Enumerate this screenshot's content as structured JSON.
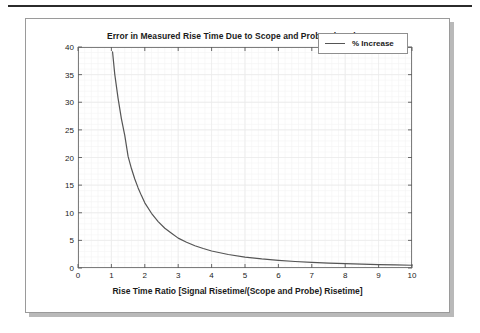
{
  "figure": {
    "has_top_rule": true,
    "frame_border_color": "#9a9a9a",
    "shadow_color": "#b9b9b9",
    "background": "#ffffff"
  },
  "chart_data": {
    "type": "line",
    "title": "Error in Measured Rise Time Due to Scope and Probe Rise Time",
    "xlabel": "Rise Time Ratio [Signal Risetime/(Scope and Probe) Risetime]",
    "ylabel": "% Increase in Measured vs. Actual Rise Time",
    "xlim": [
      0,
      10
    ],
    "ylim": [
      0,
      40
    ],
    "xticks": [
      0,
      1,
      2,
      3,
      4,
      5,
      6,
      7,
      8,
      9,
      10
    ],
    "yticks": [
      0,
      5,
      10,
      15,
      20,
      25,
      30,
      35,
      40
    ],
    "xtick_labels": [
      "0",
      "1",
      "2",
      "3",
      "4",
      "5",
      "6",
      "7",
      "8",
      "9",
      "10"
    ],
    "ytick_labels": [
      "0",
      "5",
      "10",
      "15",
      "20",
      "25",
      "30",
      "35",
      "40"
    ],
    "grid": true,
    "grid_minor": true,
    "grid_color": "#ebebeb",
    "grid_minor_color": "#f4f4f4",
    "legend_position": "upper right",
    "series": [
      {
        "name": "% Increase",
        "color": "#555555",
        "line_width": 1.2,
        "formula": "(sqrt(1 + 1/r^2) - 1) * 100",
        "x": [
          1.035,
          1.1,
          1.2,
          1.3,
          1.4,
          1.5,
          1.6,
          1.7,
          1.8,
          1.9,
          2.0,
          2.2,
          2.4,
          2.6,
          2.8,
          3.0,
          3.25,
          3.5,
          3.75,
          4.0,
          4.5,
          5.0,
          5.5,
          6.0,
          6.5,
          7.0,
          7.5,
          8.0,
          8.5,
          9.0,
          9.5,
          10.0
        ],
        "y": [
          39.1,
          35.1,
          30.7,
          27.0,
          24.0,
          20.2,
          18.0,
          16.1,
          14.5,
          13.1,
          11.8,
          9.9,
          8.4,
          7.2,
          6.3,
          5.41,
          4.65,
          4.03,
          3.53,
          3.08,
          2.44,
          1.98,
          1.64,
          1.38,
          1.18,
          1.02,
          0.89,
          0.78,
          0.69,
          0.62,
          0.55,
          0.5
        ],
        "note_top_entry": "curve exceeds 40% below r=1.035 and exits top of axes"
      }
    ]
  },
  "legend": {
    "entries": [
      {
        "label": "% Increase"
      }
    ]
  }
}
